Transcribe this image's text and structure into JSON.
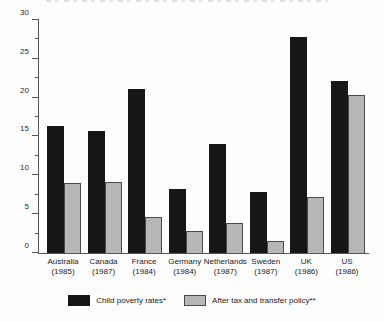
{
  "chart_data": {
    "type": "bar",
    "title": "",
    "categories": [
      "Australia",
      "Canada",
      "France",
      "Germany",
      "Netherlands",
      "Sweden",
      "UK",
      "US"
    ],
    "category_years": [
      "(1985)",
      "(1987)",
      "(1984)",
      "(1984)",
      "(1987)",
      "(1987)",
      "(1986)",
      "(1986)"
    ],
    "series": [
      {
        "name": "Child poverty rates*",
        "color": "#161616",
        "values": [
          16.4,
          15.7,
          21.1,
          8.3,
          14.0,
          7.9,
          27.8,
          22.1
        ]
      },
      {
        "name": "After tax and transfer policy**",
        "color": "#b7b7b7",
        "values": [
          9.0,
          9.2,
          4.6,
          2.8,
          3.8,
          1.6,
          7.2,
          20.3
        ]
      }
    ],
    "xlabel": "",
    "ylabel": "",
    "ylim": [
      0,
      30
    ],
    "yticks": [
      0,
      5,
      10,
      15,
      20,
      25,
      30
    ],
    "minor_tick_step": 2.5,
    "grid": false,
    "legend_position": "bottom"
  },
  "colors": {
    "axis": "#555555",
    "background": "#fdfdfd",
    "black_bar": "#161616",
    "gray_bar": "#b7b7b7",
    "gray_bar_border": "#4a4a4a"
  }
}
